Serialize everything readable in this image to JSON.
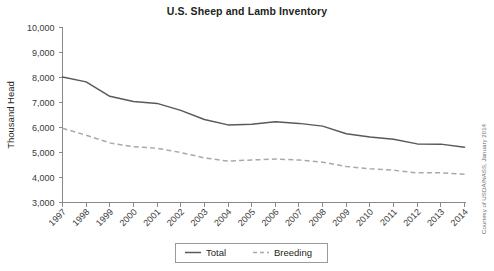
{
  "chart_data": {
    "type": "line",
    "title": "U.S. Sheep and Lamb Inventory",
    "xlabel": "",
    "ylabel": "Thousand Head",
    "categories": [
      "1997",
      "1998",
      "1999",
      "2000",
      "2001",
      "2002",
      "2003",
      "2004",
      "2005",
      "2006",
      "2007",
      "2008",
      "2009",
      "2010",
      "2011",
      "2012",
      "2013",
      "2014"
    ],
    "x": [
      1997,
      1998,
      1999,
      2000,
      2001,
      2002,
      2003,
      2004,
      2005,
      2006,
      2007,
      2008,
      2009,
      2010,
      2011,
      2012,
      2013,
      2014
    ],
    "series": [
      {
        "name": "Total",
        "style": "solid",
        "color": "#58595b",
        "values": [
          8024,
          7825,
          7247,
          7036,
          6965,
          6685,
          6321,
          6105,
          6135,
          6230,
          6165,
          6055,
          5747,
          5620,
          5530,
          5345,
          5335,
          5210
        ]
      },
      {
        "name": "Breeding",
        "style": "dashed",
        "color": "#a7a9ac",
        "values": [
          5970,
          5690,
          5385,
          5230,
          5170,
          5000,
          4785,
          4655,
          4700,
          4740,
          4700,
          4615,
          4440,
          4350,
          4290,
          4185,
          4190,
          4130
        ]
      }
    ],
    "ylim": [
      3000,
      10000
    ],
    "ytick_values": [
      3000,
      4000,
      5000,
      6000,
      7000,
      8000,
      9000,
      10000
    ],
    "ytick_labels": [
      "3,000",
      "4,000",
      "5,000",
      "6,000",
      "7,000",
      "8,000",
      "9,000",
      "10,000"
    ],
    "grid": false,
    "legend_position": "bottom-center",
    "legend_entries": [
      "Total",
      "Breeding"
    ]
  },
  "credit": {
    "text": "Courtesy of USDA/NASS, January 2014"
  },
  "colors": {
    "total": "#58595b",
    "breeding": "#a7a9ac",
    "axis": "#8a8a8a",
    "text": "#231f20",
    "background": "#ffffff"
  }
}
